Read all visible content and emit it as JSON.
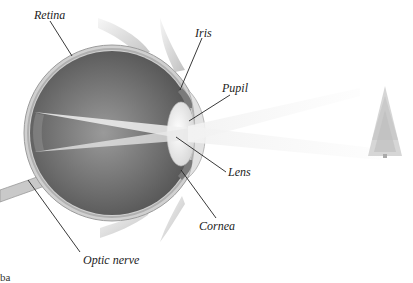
{
  "diagram": {
    "labels": {
      "retina": "Retina",
      "iris": "Iris",
      "pupil": "Pupil",
      "lens": "Lens",
      "cornea": "Cornea",
      "optic_nerve": "Optic nerve"
    },
    "caption_fragment": "ba",
    "object": "tree-icon",
    "colors": {
      "eyeball_dark": "#5a5a5a",
      "eyeball_mid": "#8a8a8a",
      "sclera": "#c8c8c8",
      "light_rays": "#eeeeee",
      "leader_lines": "#222222",
      "background": "#ffffff"
    }
  }
}
